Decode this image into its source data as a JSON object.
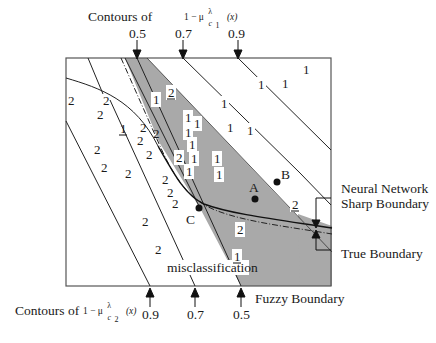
{
  "top_axis": {
    "title": "Contours of",
    "expr": "1 − μ",
    "expr_sup": "λ",
    "expr_sub": "c",
    "expr_sub_index": "1",
    "expr_arg": "(x)",
    "ticks": [
      {
        "label": "0.5",
        "x": 137
      },
      {
        "label": "0.7",
        "x": 183
      },
      {
        "label": "0.9",
        "x": 238
      }
    ]
  },
  "bottom_axis": {
    "title": "Contours of",
    "expr": "1 − μ",
    "expr_sup": "λ",
    "expr_sub": "c",
    "expr_sub_index": "2",
    "expr_arg": "(x)",
    "ticks": [
      {
        "label": "0.9",
        "x": 150
      },
      {
        "label": "0.7",
        "x": 195
      },
      {
        "label": "0.5",
        "x": 241
      }
    ]
  },
  "annotations": {
    "neural_network_line1": "Neural Network",
    "neural_network_line2": "Sharp Boundary",
    "true_boundary": "True Boundary",
    "fuzzy_boundary": "Fuzzy Boundary",
    "misclassification": "misclassification"
  },
  "points": [
    {
      "label": "A",
      "x": 255,
      "y": 199
    },
    {
      "label": "B",
      "x": 277,
      "y": 182
    },
    {
      "label": "C",
      "x": 199,
      "y": 208
    }
  ],
  "class_labels": {
    "class1_white": [
      {
        "t": "1",
        "x": 302,
        "y": 63
      },
      {
        "t": "1",
        "x": 257,
        "y": 78
      },
      {
        "t": "1",
        "x": 281,
        "y": 77
      },
      {
        "t": "1",
        "x": 220,
        "y": 97
      },
      {
        "t": "1",
        "x": 226,
        "y": 121
      },
      {
        "t": "1",
        "x": 246,
        "y": 124
      }
    ],
    "class1_boxed": [
      {
        "t": "1",
        "x": 152,
        "y": 93
      },
      {
        "t": "1",
        "x": 184,
        "y": 111
      },
      {
        "t": "1",
        "x": 193,
        "y": 117
      },
      {
        "t": "1",
        "x": 184,
        "y": 126
      },
      {
        "t": "1",
        "x": 188,
        "y": 138
      },
      {
        "t": "1",
        "x": 190,
        "y": 152
      },
      {
        "t": "1",
        "x": 213,
        "y": 152
      },
      {
        "t": "1",
        "x": 185,
        "y": 165
      },
      {
        "t": "1",
        "x": 215,
        "y": 168
      }
    ],
    "class2_in_gray": [
      {
        "t": "2",
        "x": 167,
        "y": 86,
        "underline": true
      },
      {
        "t": "2",
        "x": 175,
        "y": 151
      },
      {
        "t": "2",
        "x": 236,
        "y": 223
      },
      {
        "t": "2",
        "x": 291,
        "y": 198,
        "underline": true
      }
    ],
    "class1_in_gray_bottom": [
      {
        "t": "1",
        "x": 233,
        "y": 250,
        "underline": true
      }
    ],
    "class2_white": [
      {
        "t": "2",
        "x": 67,
        "y": 94
      },
      {
        "t": "2",
        "x": 102,
        "y": 94
      },
      {
        "t": "2",
        "x": 96,
        "y": 108
      },
      {
        "t": "2",
        "x": 139,
        "y": 121
      },
      {
        "t": "2",
        "x": 136,
        "y": 134
      },
      {
        "t": "2",
        "x": 152,
        "y": 127
      },
      {
        "t": "2",
        "x": 145,
        "y": 148
      },
      {
        "t": "2",
        "x": 93,
        "y": 143
      },
      {
        "t": "2",
        "x": 100,
        "y": 161
      },
      {
        "t": "2",
        "x": 124,
        "y": 167
      },
      {
        "t": "2",
        "x": 161,
        "y": 173
      },
      {
        "t": "2",
        "x": 166,
        "y": 186
      },
      {
        "t": "2",
        "x": 171,
        "y": 197
      },
      {
        "t": "2",
        "x": 141,
        "y": 215
      },
      {
        "t": "2",
        "x": 154,
        "y": 243
      }
    ],
    "class1_white_left": [
      {
        "t": "1",
        "x": 119,
        "y": 122,
        "underline": true
      }
    ]
  },
  "colors": {
    "gray_region": "#a9a9a9",
    "line": "#222222",
    "box": "#555555",
    "label_bg": "#ffffff"
  }
}
